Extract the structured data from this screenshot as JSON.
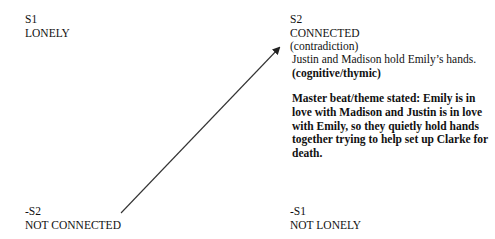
{
  "diagram": {
    "type": "semiotic-square",
    "corners": {
      "s1": {
        "code": "S1",
        "label": "LONELY"
      },
      "s2": {
        "code": "S2",
        "label": "CONNECTED",
        "relation": "(contradiction)"
      },
      "neg_s2": {
        "code": "-S2",
        "label": "NOT CONNECTED"
      },
      "neg_s1": {
        "code": "-S1",
        "label": "NOT LONELY"
      }
    },
    "s2_details": {
      "description": "Justin and Madison hold Emily’s hands.",
      "tag": "(cognitive/thymic)",
      "master_beat": "Master beat/theme stated: Emily is in love with Madison and Justin is in love with Emily, so they quietly hold hands together trying to help set up Clarke for death."
    },
    "arrow": {
      "from": "-S2",
      "to": "S2",
      "icon": "arrow-icon",
      "color": "#222222"
    }
  }
}
